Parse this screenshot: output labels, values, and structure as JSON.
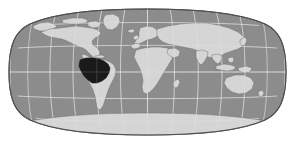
{
  "figure": {
    "name": "world-locator-map",
    "width": 295,
    "height": 144,
    "background_color": "#ffffff"
  },
  "map": {
    "projection": "eckert-iv",
    "center_longitude": 0,
    "ocean_color": "#8c8c8c",
    "land_color": "#d5d5d5",
    "land_outline_color": "#6e6e6e",
    "highlight_color": "#1a1a1a",
    "graticule_color": "#e8e8e8",
    "border_color": "#4d4d4d",
    "graticule_interval_degrees": 30,
    "bounds": {
      "left": 9,
      "right": 286,
      "top": 9,
      "bottom": 135
    }
  },
  "graticule": {
    "meridians": [
      -180,
      -150,
      -120,
      -90,
      -60,
      -30,
      0,
      30,
      60,
      90,
      120,
      150,
      180
    ],
    "parallels": [
      -60,
      -30,
      0,
      30,
      60
    ],
    "equator_label": "0",
    "visible": true
  },
  "highlight": {
    "region_name": "Brazil",
    "continent": "South America",
    "color": "#1a1a1a",
    "approx_center": {
      "x": 89,
      "y": 70
    }
  },
  "landmasses": [
    {
      "name": "North America",
      "color": "#d5d5d5"
    },
    {
      "name": "South America",
      "color": "#d5d5d5"
    },
    {
      "name": "Greenland",
      "color": "#d5d5d5"
    },
    {
      "name": "Europe",
      "color": "#d5d5d5"
    },
    {
      "name": "Africa",
      "color": "#d5d5d5"
    },
    {
      "name": "Asia",
      "color": "#d5d5d5"
    },
    {
      "name": "Australia",
      "color": "#d5d5d5"
    },
    {
      "name": "Antarctica",
      "color": "#d5d5d5"
    }
  ]
}
